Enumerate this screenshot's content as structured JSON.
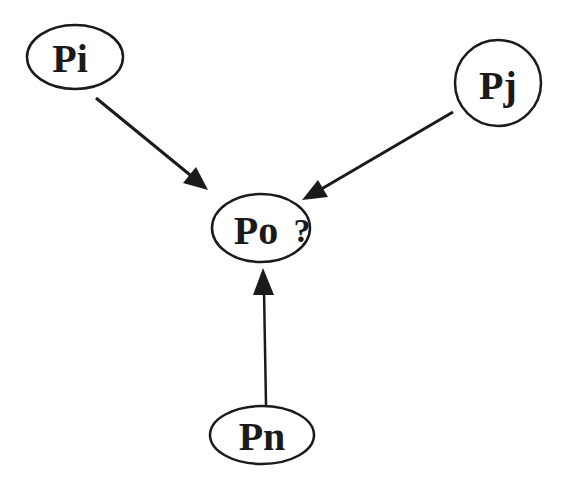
{
  "diagram": {
    "type": "directed-graph",
    "stroke_color": "#1a1a1a",
    "background": "#ffffff",
    "nodes": [
      {
        "id": "Pi",
        "label": "Pi",
        "shape": "ellipse",
        "cx": 75,
        "cy": 57,
        "rx": 48,
        "ry": 32
      },
      {
        "id": "Pj",
        "label": "Pj",
        "shape": "circle",
        "cx": 498,
        "cy": 83,
        "rx": 43,
        "ry": 43
      },
      {
        "id": "Po",
        "label": "Po",
        "suffix": "?",
        "shape": "ellipse",
        "cx": 261,
        "cy": 228,
        "rx": 49,
        "ry": 34
      },
      {
        "id": "Pn",
        "label": "Pn",
        "shape": "ellipse",
        "cx": 262,
        "cy": 435,
        "rx": 52,
        "ry": 29
      }
    ],
    "edges": [
      {
        "from": "Pi",
        "to": "Po",
        "x1": 96,
        "y1": 98,
        "x2": 208,
        "y2": 190
      },
      {
        "from": "Pj",
        "to": "Po",
        "x1": 453,
        "y1": 112,
        "x2": 302,
        "y2": 200
      },
      {
        "from": "Pn",
        "to": "Po",
        "x1": 266,
        "y1": 405,
        "x2": 263,
        "y2": 268
      }
    ]
  }
}
